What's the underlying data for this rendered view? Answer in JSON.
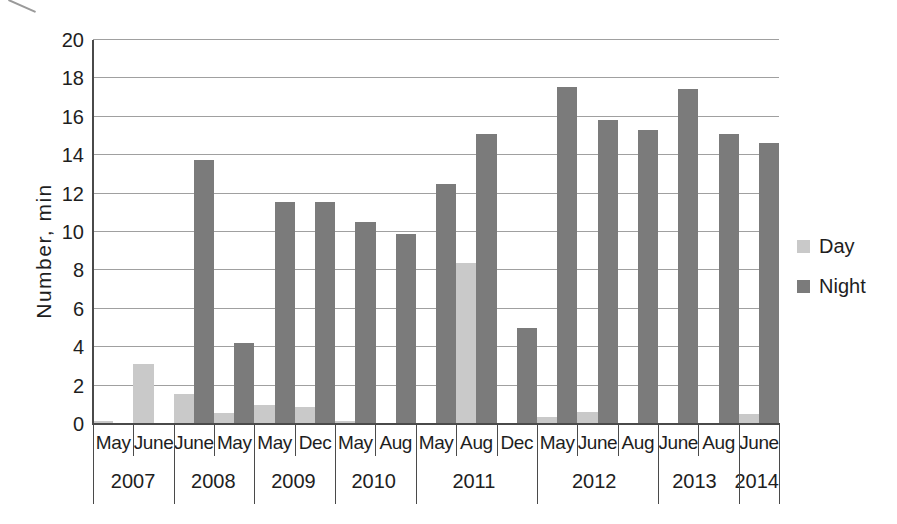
{
  "chart_data": {
    "type": "bar",
    "title": "",
    "ylabel": "Number, min",
    "xlabel": "",
    "ylim": [
      0,
      20
    ],
    "yticks": [
      0,
      2,
      4,
      6,
      8,
      10,
      12,
      14,
      16,
      18,
      20
    ],
    "grid": true,
    "legend_position": "right",
    "categories": [
      "May 2007",
      "June 2007",
      "June 2008",
      "May 2008",
      "May 2009",
      "Dec 2009",
      "May 2010",
      "Aug 2010",
      "May 2011",
      "Aug 2011",
      "Dec 2011",
      "May 2012",
      "June 2012",
      "Aug 2012",
      "June 2013",
      "Aug 2013",
      "June 2014"
    ],
    "month_labels": [
      "May",
      "June",
      "June",
      "May",
      "May",
      "Dec",
      "May",
      "Aug",
      "May",
      "Aug",
      "Dec",
      "May",
      "June",
      "Aug",
      "June",
      "Aug",
      "June"
    ],
    "year_groups": [
      {
        "label": "2007",
        "span": 2
      },
      {
        "label": "2008",
        "span": 2
      },
      {
        "label": "2009",
        "span": 2
      },
      {
        "label": "2010",
        "span": 2
      },
      {
        "label": "2011",
        "span": 3
      },
      {
        "label": "2012",
        "span": 3
      },
      {
        "label": "2013",
        "span": 2
      },
      {
        "label": "2014",
        "span": 1
      }
    ],
    "series": [
      {
        "name": "Day",
        "color": "#c9c9c9",
        "values": [
          0.15,
          3.1,
          1.55,
          0.55,
          1.0,
          0.9,
          0.15,
          0,
          0,
          8.4,
          0,
          0.35,
          0.6,
          0,
          0,
          0,
          0.5
        ]
      },
      {
        "name": "Night",
        "color": "#7b7b7b",
        "values": [
          0,
          0,
          13.75,
          4.2,
          11.55,
          11.55,
          10.5,
          9.9,
          12.5,
          15.1,
          5.0,
          17.55,
          15.85,
          15.3,
          17.45,
          15.1,
          14.65
        ]
      }
    ]
  },
  "style": {
    "grid_color": "#a0a0a0",
    "axis_color": "#4a4a4a",
    "text_color": "#1e1e1e",
    "background": "#ffffff"
  }
}
